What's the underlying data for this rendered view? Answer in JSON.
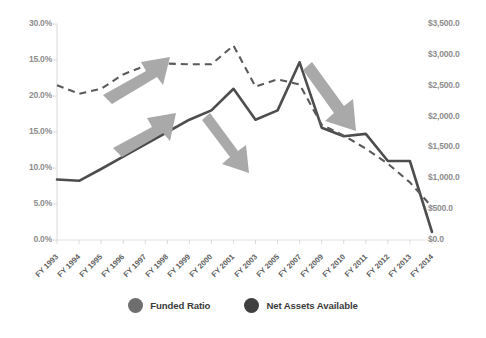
{
  "chart_data": {
    "type": "line",
    "title": "",
    "xlabel": "",
    "grid": false,
    "legend_position": "bottom",
    "categories": [
      "FY 1993",
      "FY 1994",
      "FY 1995",
      "FY 1996",
      "FY 1997",
      "FY 1998",
      "FY 1999",
      "FY 2000",
      "FY 2001",
      "FY 2003",
      "FY 2005",
      "FY 2007",
      "FY 2009",
      "FY 2010",
      "FY 2011",
      "FY 2012",
      "FY 2013",
      "FY 2014"
    ],
    "left_axis": {
      "label": "",
      "ticks": [
        "30.0%",
        "15.0%",
        "20.0%",
        "15.0%",
        "10.0%",
        "5.0%",
        "0.0%"
      ],
      "ylim": [
        0,
        30
      ]
    },
    "right_axis": {
      "label": "",
      "ticks": [
        "$3,500.0",
        "$3,000.0",
        "$2,500.0",
        "$2,000.0",
        "$1,500.0",
        "$1,000.0",
        "$500.0",
        "$0.0"
      ],
      "ylim": [
        0,
        3500
      ]
    },
    "series": [
      {
        "name": "Funded Ratio",
        "axis": "left",
        "style": "dashed",
        "color": "#5a5a5a",
        "values": [
          21.5,
          20.3,
          21.0,
          23.0,
          24.2,
          24.5,
          24.4,
          24.4,
          27.0,
          21.3,
          22.3,
          21.6,
          16.0,
          14.5,
          12.7,
          10.6,
          8.0,
          4.6
        ]
      },
      {
        "name": "Net Assets Available",
        "axis": "right",
        "style": "solid",
        "color": "#4d4d4d",
        "values": [
          980,
          960,
          1150,
          1350,
          1550,
          1750,
          1950,
          2100,
          2450,
          1950,
          2100,
          2880,
          1820,
          1680,
          1720,
          1280,
          1280,
          130
        ]
      }
    ],
    "annotations": [
      {
        "name": "up-arrow-upper",
        "direction": "up-right",
        "color": "#a9a9a9"
      },
      {
        "name": "up-arrow-lower",
        "direction": "up-right",
        "color": "#a9a9a9"
      },
      {
        "name": "down-arrow-middle",
        "direction": "down-right",
        "color": "#a9a9a9"
      },
      {
        "name": "down-arrow-right",
        "direction": "down-right",
        "color": "#a9a9a9"
      }
    ]
  },
  "legend": {
    "items": [
      {
        "label": "Funded Ratio",
        "color": "#6e6e6e"
      },
      {
        "label": "Net Assets Available",
        "color": "#3f3f3f"
      }
    ]
  },
  "colors": {
    "axis_text": "#8d8d8d",
    "category_text": "#5e5e5e",
    "arrow": "#a9a9a9",
    "baseline": "#e2e2e2"
  }
}
